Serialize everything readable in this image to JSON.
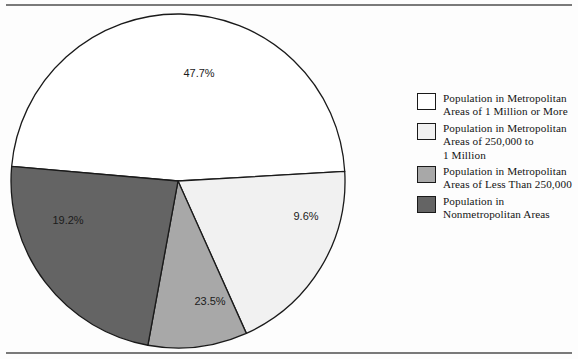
{
  "figure": {
    "clipped_caption_above_rule": "",
    "background_color": "#fdfdfd",
    "rule_color": "#7a7a7a"
  },
  "chart_data": {
    "type": "pie",
    "title": "",
    "subtitle": "",
    "xlabel": "",
    "ylabel": "",
    "legend_position": "right",
    "grid": false,
    "categories": [
      "Population in Metropolitan Areas of 1 Million or More",
      "Population in Metropolitan Areas of 250,000 to 1 Million",
      "Population in Metropolitan Areas of Less Than 250,000",
      "Population in Nonmetropolitan Areas"
    ],
    "values": [
      47.7,
      19.2,
      9.6,
      23.5
    ],
    "value_labels": [
      "47.7%",
      "19.2%",
      "9.6%",
      "23.5%"
    ],
    "units": "percent",
    "total": 100.0,
    "slices": [
      {
        "label": "Population in Metropolitan Areas of 1 Million or More",
        "legend_label": "Population in Metropolitan\nAreas of 1 Million or More",
        "value": 47.7,
        "display": "47.7%",
        "color": "#ffffff",
        "stroke": "#1a1a1a",
        "label_x": 199,
        "label_y": 74
      },
      {
        "label": "Population in Metropolitan Areas of 250,000 to 1 Million",
        "legend_label": "Population in Metropolitan\nAreas of 250,000 to\n1 Million",
        "value": 19.2,
        "display": "19.2%",
        "color": "#f1f1f1",
        "stroke": "#1a1a1a",
        "label_x": 68,
        "label_y": 221
      },
      {
        "label": "Population in Metropolitan Areas of Less Than 250,000",
        "legend_label": "Population in Metropolitan\nAreas of Less Than 250,000",
        "value": 9.6,
        "display": "9.6%",
        "color": "#a8a8a8",
        "stroke": "#1a1a1a",
        "label_x": 306,
        "label_y": 217
      },
      {
        "label": "Population in Nonmetropolitan Areas",
        "legend_label": "Population in\nNonmetropolitan Areas",
        "value": 23.5,
        "display": "23.5%",
        "color": "#646464",
        "stroke": "#1a1a1a",
        "label_x": 210,
        "label_y": 302
      }
    ],
    "geometry": {
      "center_x": 178,
      "center_y": 181,
      "radius": 167,
      "start_angle_deg": 185
    }
  },
  "legend": {
    "items": [
      {
        "swatch_color": "#ffffff",
        "text": "Population in Metropolitan\nAreas of 1 Million or More"
      },
      {
        "swatch_color": "#f1f1f1",
        "text": "Population in Metropolitan\nAreas of 250,000 to\n1 Million"
      },
      {
        "swatch_color": "#a8a8a8",
        "text": "Population in Metropolitan\nAreas of Less Than 250,000"
      },
      {
        "swatch_color": "#646464",
        "text": "Population in\nNonmetropolitan Areas"
      }
    ]
  }
}
